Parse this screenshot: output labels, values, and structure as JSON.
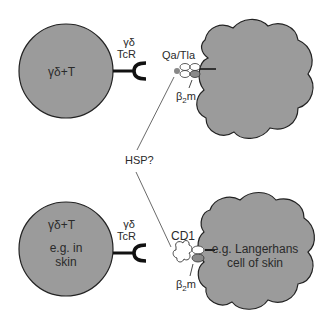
{
  "colors": {
    "cell_fill": "#9b9b9b",
    "outline": "#222222",
    "b2m_fill": "#8a8a8a",
    "background": "#ffffff"
  },
  "top": {
    "t_cell_label": "γδ+T",
    "receptor_label_line1": "γδ",
    "receptor_label_line2": "TcR",
    "molecule_label": "Qa/Tla",
    "b2m_label": "β",
    "b2m_sub": "2",
    "b2m_suffix": "m"
  },
  "center": {
    "hsp_label": "HSP?"
  },
  "bottom": {
    "t_cell_label": "γδ+T",
    "t_cell_note_line1": "e.g. in",
    "t_cell_note_line2": "skin",
    "receptor_label_line1": "γδ",
    "receptor_label_line2": "TcR",
    "molecule_label": "CD1",
    "apc_label_line1": "e.g. Langerhans",
    "apc_label_line2": "cell of skin",
    "b2m_label": "β",
    "b2m_sub": "2",
    "b2m_suffix": "m"
  }
}
